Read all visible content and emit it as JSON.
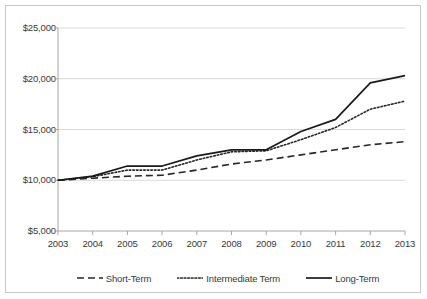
{
  "chart_data": {
    "type": "line",
    "title": "",
    "subtitle": "",
    "xlabel": "",
    "ylabel": "",
    "categories": [
      "2003",
      "2004",
      "2005",
      "2006",
      "2007",
      "2008",
      "2009",
      "2010",
      "2011",
      "2012",
      "2013"
    ],
    "ylim": [
      5000,
      25000
    ],
    "ytick_values": [
      25000,
      20000,
      15000,
      10000,
      5000
    ],
    "ytick_labels": [
      "$25,000",
      "$20,000",
      "$15,000",
      "$10,000",
      "$5,000"
    ],
    "grid": true,
    "grid_axis": "y",
    "legend_position": "bottom",
    "series": [
      {
        "name": "Short-Term",
        "style": "dashed",
        "color": "#262626",
        "values": [
          10000,
          10200,
          10400,
          10500,
          11000,
          11600,
          12000,
          12500,
          13000,
          13500,
          13800
        ]
      },
      {
        "name": "Intermediate Term",
        "style": "dotted",
        "color": "#262626",
        "values": [
          10000,
          10350,
          11000,
          11000,
          12000,
          12800,
          12900,
          14000,
          15200,
          17000,
          17800
        ]
      },
      {
        "name": "Long-Term",
        "style": "solid",
        "color": "#1a1a1a",
        "values": [
          10000,
          10400,
          11400,
          11400,
          12400,
          13000,
          13000,
          14800,
          16000,
          19600,
          20300
        ]
      }
    ]
  },
  "axis": {
    "y_labels": [
      "$25,000",
      "$20,000",
      "$15,000",
      "$10,000",
      "$5,000"
    ],
    "x_labels": [
      "2003",
      "2004",
      "2005",
      "2006",
      "2007",
      "2008",
      "2009",
      "2010",
      "2011",
      "2012",
      "2013"
    ]
  },
  "legend": {
    "items": [
      {
        "label": "Short-Term"
      },
      {
        "label": "Intermediate Term"
      },
      {
        "label": "Long-Term"
      }
    ]
  },
  "colors": {
    "frame_border": "#c8c8c8",
    "gridline": "#d9d9d9",
    "axis_line": "#a6a6a6",
    "text": "#3a3a3a",
    "series_line": "#1a1a1a"
  }
}
